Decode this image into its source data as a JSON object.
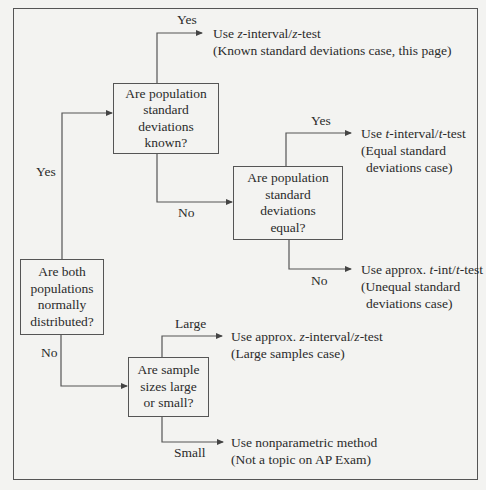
{
  "diagram": {
    "type": "decision-flowchart",
    "colors": {
      "background": "#f3f3f1",
      "line": "#555555",
      "text": "#2b2b2b"
    },
    "nodes": {
      "q_normal": {
        "text": "Are both\npopulations\nnormally\ndistributed?"
      },
      "q_sd_known": {
        "text": "Are population\nstandard\ndeviations\nknown?"
      },
      "q_sd_equal": {
        "text": "Are population\nstandard\ndeviations\nequal?"
      },
      "q_sample_size": {
        "text": "Are sample\nsizes large\nor small?"
      }
    },
    "outcomes": {
      "z_known": {
        "line1_pre": "Use ",
        "line1_var1": "z",
        "line1_mid": "-interval/",
        "line1_var2": "z",
        "line1_post": "-test",
        "line2": "(Known standard deviations case, this page)"
      },
      "t_equal": {
        "line1_pre": "Use ",
        "line1_var1": "t",
        "line1_mid": "-interval/",
        "line1_var2": "t",
        "line1_post": "-test",
        "line2": "(Equal standard",
        "line3": "deviations case)"
      },
      "t_unequal": {
        "line1_pre": "Use approx. ",
        "line1_var1": "t",
        "line1_mid": "-int/",
        "line1_var2": "t",
        "line1_post": "-test",
        "line2": "(Unequal standard",
        "line3": "deviations case)"
      },
      "z_large": {
        "line1_pre": "Use approx. ",
        "line1_var1": "z",
        "line1_mid": "-interval/",
        "line1_var2": "z",
        "line1_post": "-test",
        "line2": "(Large samples case)"
      },
      "nonparametric": {
        "line1": "Use nonparametric method",
        "line2": "(Not a topic on AP Exam)"
      }
    },
    "edge_labels": {
      "normal_yes": "Yes",
      "normal_no": "No",
      "known_yes": "Yes",
      "known_no": "No",
      "equal_yes": "Yes",
      "equal_no": "No",
      "size_large": "Large",
      "size_small": "Small"
    }
  }
}
